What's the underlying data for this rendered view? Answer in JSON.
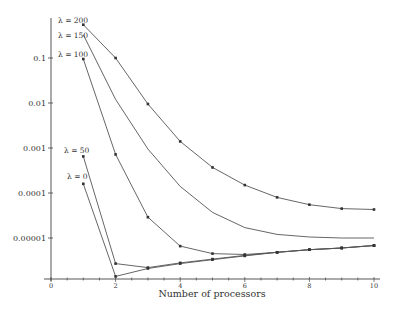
{
  "chart_data": {
    "type": "line",
    "title": "",
    "xlabel": "Number of processors",
    "ylabel": "",
    "yscale": "log",
    "xlim": [
      0,
      10
    ],
    "ylim": [
      1.5e-06,
      0.6
    ],
    "grid": false,
    "legend": "inline labels at start of each curve",
    "x_ticks": [
      0,
      2,
      4,
      6,
      8,
      10
    ],
    "y_ticks": [
      {
        "value": 0.1,
        "label": "0.1"
      },
      {
        "value": 0.01,
        "label": "0.01"
      },
      {
        "value": 0.001,
        "label": "0.001"
      },
      {
        "value": 0.0001,
        "label": "0.0001"
      },
      {
        "value": 1e-05,
        "label": "0.00001"
      }
    ],
    "series": [
      {
        "name": "λ = 200",
        "markers": true,
        "x": [
          1,
          2,
          3,
          4,
          5,
          6,
          7,
          8,
          9,
          10
        ],
        "y": [
          0.55,
          0.1,
          0.0095,
          0.0014,
          0.00037,
          0.00015,
          8e-05,
          5.5e-05,
          4.5e-05,
          4.3e-05
        ]
      },
      {
        "name": "λ = 150",
        "markers": false,
        "x": [
          1,
          2,
          3,
          4,
          5,
          6,
          7,
          8,
          9,
          10
        ],
        "y": [
          0.33,
          0.012,
          0.00095,
          0.00014,
          3.7e-05,
          1.7e-05,
          1.2e-05,
          1.05e-05,
          1e-05,
          1e-05
        ]
      },
      {
        "name": "λ = 100",
        "markers": true,
        "x": [
          1,
          2,
          3,
          4,
          5,
          6,
          7,
          8,
          9,
          10
        ],
        "y": [
          0.095,
          0.00072,
          2.9e-05,
          6.6e-06,
          4.5e-06,
          4.3e-06,
          4.8e-06,
          5.5e-06,
          6e-06,
          6.8e-06
        ]
      },
      {
        "name": "λ = 50",
        "markers": true,
        "x": [
          1,
          2,
          3,
          4,
          5,
          6,
          7,
          8,
          9,
          10
        ],
        "y": [
          0.00065,
          2.7e-06,
          2.2e-06,
          2.8e-06,
          3.4e-06,
          4.1e-06,
          4.8e-06,
          5.5e-06,
          6e-06,
          6.8e-06
        ]
      },
      {
        "name": "λ = 0",
        "markers": true,
        "x": [
          1,
          2,
          3,
          4,
          5,
          6,
          7,
          8,
          9,
          10
        ],
        "y": [
          0.00016,
          1.4e-06,
          2.1e-06,
          2.7e-06,
          3.3e-06,
          4e-06,
          4.8e-06,
          5.5e-06,
          6e-06,
          6.8e-06
        ]
      }
    ]
  },
  "layout": {
    "x0_px": 51,
    "x_unit_px": 32.3,
    "y_decade_px": 45,
    "y_at_0_1_px": 58,
    "x_axis_y_px": 279,
    "y_axis_x_px": 51,
    "label_positions": [
      {
        "x": 58,
        "y": 23
      },
      {
        "x": 58,
        "y": 38
      },
      {
        "x": 58,
        "y": 57
      },
      {
        "x": 64,
        "y": 153
      },
      {
        "x": 67,
        "y": 179
      }
    ]
  }
}
